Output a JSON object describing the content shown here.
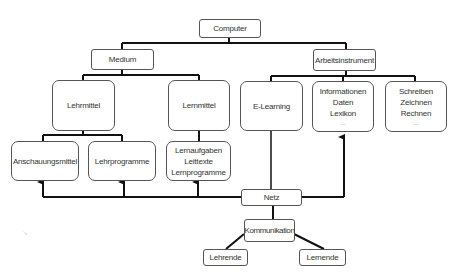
{
  "diagram": {
    "root": {
      "label": "Computer"
    },
    "level1": [
      {
        "label": "Medium"
      },
      {
        "label": "Arbeitsinstrument"
      }
    ],
    "medium_children": [
      {
        "label": "Lehrmittel"
      },
      {
        "label": "Lernmittel"
      }
    ],
    "lehrmittel_children": [
      {
        "label": "Anschauungsmittel"
      },
      {
        "label": "Lehrprogramme"
      }
    ],
    "lernmittel_children": [
      {
        "lines": [
          "Lernaufgaben",
          "Leittexte",
          "Lernprogramme"
        ]
      }
    ],
    "arbeitsinstrument_children": [
      {
        "label": "E-Learning"
      },
      {
        "lines": [
          "Informationen",
          "Daten",
          "Lexikon",
          "..."
        ]
      },
      {
        "lines": [
          "Schreiben",
          "Zeichnen",
          "Rechnen",
          "..."
        ]
      }
    ],
    "network": {
      "label": "Netz"
    },
    "communication": {
      "label": "Kommunikation"
    },
    "participants": [
      {
        "label": "Lehrende"
      },
      {
        "label": "Lernende"
      }
    ],
    "watermark": "↘",
    "colors": {
      "line": "#111111",
      "border": "#555555",
      "text": "#333333"
    }
  }
}
